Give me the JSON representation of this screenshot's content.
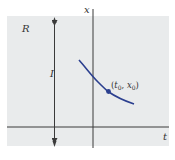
{
  "diagram": {
    "region_label": "R",
    "interval_label": "I",
    "x_axis_label": "x",
    "t_axis_label": "t",
    "point_label_t": "t",
    "point_label_t_sub": "0",
    "point_label_sep": ", ",
    "point_label_x": "x",
    "point_label_x_sub": "0",
    "point_label_open": "(",
    "point_label_close": ")",
    "colors": {
      "region_fill": "#e9ebec",
      "axis": "#3a3a3a",
      "curve": "#2b3f8f",
      "point": "#2b3f8f",
      "text": "#333333"
    }
  }
}
